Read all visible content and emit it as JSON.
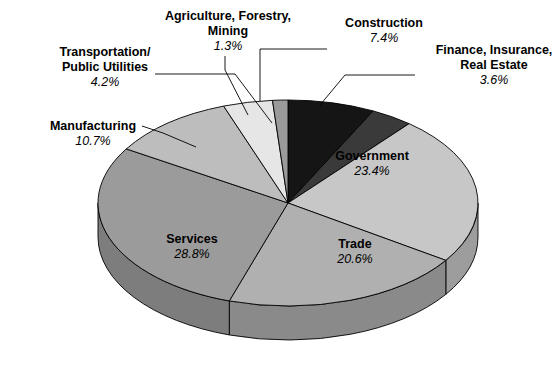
{
  "chart_data": {
    "type": "pie",
    "title": "",
    "subtitle": "",
    "xlabel": "",
    "ylabel": "",
    "legend_position": "none",
    "grid": false,
    "value_unit": "percent",
    "total": 100.0,
    "categories": [
      "Government",
      "Trade",
      "Services",
      "Manufacturing",
      "Transportation/\nPublic Utilities",
      "Agriculture, Forestry,\nMining",
      "Construction",
      "Finance, Insurance,\nReal Estate"
    ],
    "values": [
      23.4,
      20.6,
      28.8,
      10.7,
      4.2,
      1.3,
      7.4,
      3.6
    ],
    "slices": [
      {
        "id": "government",
        "label": "Government",
        "label_line1": "Government",
        "label_line2": "",
        "value": 23.4,
        "pct_text": "23.4%",
        "color": "#c7c7c7",
        "side_color": "#9d9d9d",
        "label_placement": "inside",
        "label_x": 372,
        "label_y": 160
      },
      {
        "id": "trade",
        "label": "Trade",
        "label_line1": "Trade",
        "label_line2": "",
        "value": 20.6,
        "pct_text": "20.6%",
        "color": "#b0b0b0",
        "side_color": "#8a8a8a",
        "label_placement": "inside",
        "label_x": 355,
        "label_y": 248
      },
      {
        "id": "services",
        "label": "Services",
        "label_line1": "Services",
        "label_line2": "",
        "value": 28.8,
        "pct_text": "28.8%",
        "color": "#9b9b9b",
        "side_color": "#7d7d7d",
        "label_placement": "inside",
        "label_x": 192,
        "label_y": 243
      },
      {
        "id": "manufacturing",
        "label": "Manufacturing",
        "label_line1": "Manufacturing",
        "label_line2": "",
        "value": 10.7,
        "pct_text": "10.7%",
        "color": "#bdbdbd",
        "side_color": "#949494",
        "label_placement": "outside",
        "label_x": 93,
        "label_y": 130
      },
      {
        "id": "transportation-public-utilities",
        "label": "Transportation/ Public Utilities",
        "label_line1": "Transportation/",
        "label_line2": "Public Utilities",
        "value": 4.2,
        "pct_text": "4.2%",
        "color": "#e6e6e6",
        "side_color": "#bcbcbc",
        "label_placement": "outside",
        "label_x": 105,
        "label_y": 56
      },
      {
        "id": "agriculture-forestry-mining",
        "label": "Agriculture, Forestry, Mining",
        "label_line1": "Agriculture, Forestry,",
        "label_line2": "Mining",
        "value": 1.3,
        "pct_text": "1.3%",
        "color": "#9a9a9a",
        "side_color": "#7a7a7a",
        "label_placement": "outside",
        "label_x": 228,
        "label_y": 20
      },
      {
        "id": "construction",
        "label": "Construction",
        "label_line1": "Construction",
        "label_line2": "",
        "value": 7.4,
        "pct_text": "7.4%",
        "color": "#151515",
        "side_color": "#0d0d0d",
        "label_placement": "outside",
        "label_x": 384,
        "label_y": 27
      },
      {
        "id": "finance-insurance-real-estate",
        "label": "Finance, Insurance, Real Estate",
        "label_line1": "Finance, Insurance,",
        "label_line2": "Real Estate",
        "value": 3.6,
        "pct_text": "3.6%",
        "color": "#3a3a3a",
        "side_color": "#2a2a2a",
        "label_placement": "outside",
        "label_x": 494,
        "label_y": 54
      }
    ],
    "geometry": {
      "cx": 288,
      "cy": 203,
      "rx": 190,
      "ry": 103,
      "depth": 34,
      "start_angle_deg": -90
    }
  }
}
